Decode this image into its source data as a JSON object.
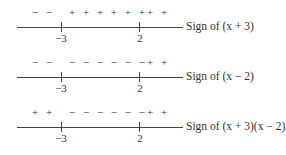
{
  "diagram": {
    "type": "sign-chart",
    "critical_points": [
      "-3",
      "2"
    ],
    "rows": [
      {
        "signs_left": "− −",
        "signs_middle": "+ + + + + +",
        "signs_right": "+ +",
        "tick_left_label": "−3",
        "tick_right_label": "2",
        "caption": "Sign of (x + 3)"
      },
      {
        "signs_left": "− −",
        "signs_middle": "− − − − − −",
        "signs_right": "+ +",
        "tick_left_label": "−3",
        "tick_right_label": "2",
        "caption": "Sign of (x − 2)"
      },
      {
        "signs_left": "+ +",
        "signs_middle": "− − − − − −",
        "signs_right": "+ +",
        "tick_left_label": "−3",
        "tick_right_label": "2",
        "caption": "Sign of (x + 3)(x − 2)"
      }
    ]
  }
}
